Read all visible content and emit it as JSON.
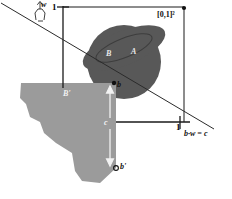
{
  "figure": {
    "type": "geometric-diagram",
    "background_color": "#ffffff",
    "palette": {
      "dark_region": "#585858",
      "dark_region_ring": "#4e4e4e",
      "light_region": "#9b9b9b",
      "axis": "#1a1a1a",
      "line": "#2b2b2b",
      "label_dark": "#111111",
      "label_light": "#efefef"
    },
    "labels": {
      "unit_square": "[0,1]²",
      "axis_top_one": "1",
      "axis_bottom_one": "1",
      "w_vector": "w",
      "region_a": "A",
      "region_b": "B",
      "region_b_prime": "B'",
      "point_b": "b",
      "point_b_prime": "b'",
      "distance_c": "c",
      "halfplane_equation": "b·w = c"
    }
  }
}
